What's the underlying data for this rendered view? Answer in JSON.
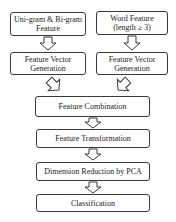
{
  "diagram": {
    "type": "flowchart",
    "nodes": [
      {
        "id": "unigram",
        "lines": [
          "Uni-gram & Bi-gram",
          "Feature"
        ]
      },
      {
        "id": "word",
        "lines": [
          "Word Feature",
          "(length ≥ 3)"
        ]
      },
      {
        "id": "fvg_left",
        "lines": [
          "Feature Vector",
          "Generation"
        ]
      },
      {
        "id": "fvg_right",
        "lines": [
          "Feature Vector",
          "Generation"
        ]
      },
      {
        "id": "combination",
        "lines": [
          "Feature Combination"
        ]
      },
      {
        "id": "transformation",
        "lines": [
          "Feature Transformation"
        ]
      },
      {
        "id": "pca",
        "lines": [
          "Dimension Reduction by PCA"
        ]
      },
      {
        "id": "classification",
        "lines": [
          "Classification"
        ]
      }
    ],
    "edges": [
      {
        "from": "unigram",
        "to": "fvg_left"
      },
      {
        "from": "word",
        "to": "fvg_right"
      },
      {
        "from": "fvg_left",
        "to": "combination"
      },
      {
        "from": "fvg_right",
        "to": "combination"
      },
      {
        "from": "combination",
        "to": "transformation"
      },
      {
        "from": "transformation",
        "to": "pca"
      },
      {
        "from": "pca",
        "to": "classification"
      }
    ],
    "colors": {
      "border": "#3a3a3a",
      "arrow": "#3a3a3a",
      "background": "#ffffff"
    }
  }
}
